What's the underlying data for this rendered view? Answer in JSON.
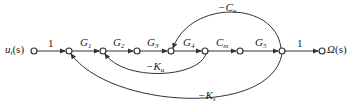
{
  "diagram": {
    "type": "signal-flow-graph",
    "input": {
      "label": "u",
      "sub": "i",
      "arg": "(s)"
    },
    "output": {
      "label": "Ω",
      "arg": "(s)"
    },
    "forward_gains": [
      {
        "text": "1"
      },
      {
        "text": "G",
        "sub": "1"
      },
      {
        "text": "G",
        "sub": "2"
      },
      {
        "text": "G",
        "sub": "3"
      },
      {
        "text": "G",
        "sub": "4"
      },
      {
        "text": "C",
        "sub": "m"
      },
      {
        "text": "G",
        "sub": "5"
      },
      {
        "text": "1"
      }
    ],
    "feedback_gains": [
      {
        "text": "−C",
        "sub": "a",
        "from_node": 7,
        "to_node": 4
      },
      {
        "text": "−K",
        "sub": "a",
        "from_node": 5,
        "to_node": 2
      },
      {
        "text": "−K",
        "sub": "s",
        "from_node": 7,
        "to_node": 1
      }
    ],
    "node_count": 9,
    "line_color": "#333333"
  }
}
